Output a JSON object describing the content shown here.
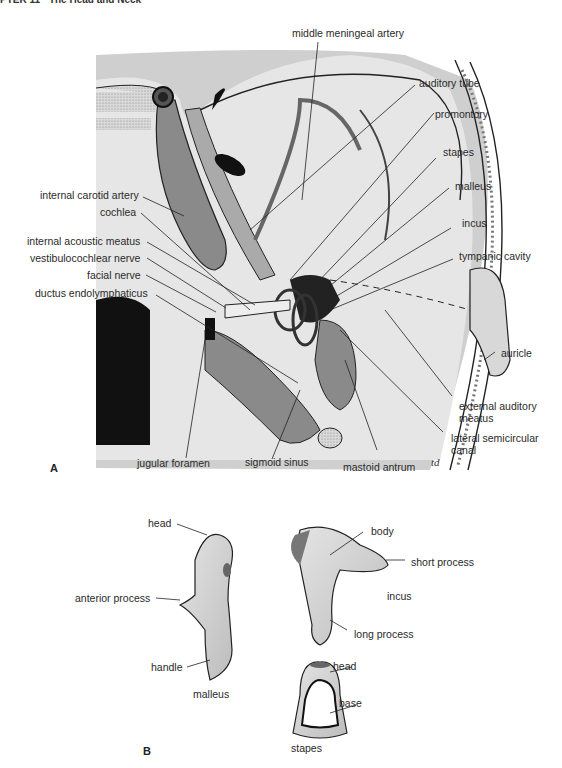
{
  "header": {
    "text": "PTER 11 · The Head and Neck"
  },
  "panelA": {
    "letter": "A",
    "signature": "td",
    "labels": {
      "middle_meningeal_artery": "middle meningeal artery",
      "auditory_tube": "auditory tube",
      "promontory": "promontory",
      "stapes": "stapes",
      "malleus": "malleus",
      "incus": "incus",
      "tympanic_cavity": "tympanic cavity",
      "auricle": "auricle",
      "external_auditory_meatus_1": "external auditory",
      "external_auditory_meatus_2": "meatus",
      "lateral_semicircular_canal_1": "lateral semicircular",
      "lateral_semicircular_canal_2": "canal",
      "mastoid_antrum": "mastoid antrum",
      "sigmoid_sinus": "sigmoid sinus",
      "jugular_foramen": "jugular foramen",
      "internal_carotid_artery": "internal carotid artery",
      "cochlea": "cochlea",
      "internal_acoustic_meatus": "internal acoustic meatus",
      "vestibulocochlear_nerve": "vestibulocochlear nerve",
      "facial_nerve": "facial nerve",
      "ductus_endolymphaticus": "ductus endolymphaticus"
    }
  },
  "panelB": {
    "letter": "B",
    "malleus": {
      "name": "malleus",
      "head": "head",
      "anterior_process": "anterior process",
      "handle": "handle"
    },
    "incus": {
      "name": "incus",
      "body": "body",
      "short_process": "short process",
      "long_process": "long process"
    },
    "stapes": {
      "name": "stapes",
      "head": "head",
      "base": "base"
    }
  },
  "colors": {
    "bone_gray": "#cfcfcf",
    "dark_gray": "#8a8a8a",
    "mid_gray": "#a9a9a9",
    "black": "#111111"
  }
}
